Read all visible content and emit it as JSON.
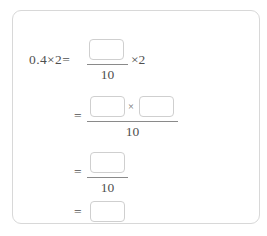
{
  "card": {
    "border_color": "#d8d8d8",
    "background": "#ffffff"
  },
  "problem": {
    "expression": "0.4×2=",
    "lines": [
      {
        "id": "line-1",
        "equals": "",
        "lead": "0.4×2=",
        "numerator_boxes": 1,
        "denominator": "10",
        "trailing": "×2"
      },
      {
        "id": "line-2",
        "equals": "=",
        "lead": "",
        "numerator_boxes": 2,
        "numerator_operator": "×",
        "denominator": "10",
        "trailing": ""
      },
      {
        "id": "line-3",
        "equals": "=",
        "lead": "",
        "numerator_boxes": 1,
        "denominator": "10",
        "trailing": ""
      },
      {
        "id": "line-4",
        "equals": "=",
        "lead": "",
        "numerator_boxes": 1,
        "denominator": "",
        "trailing": ""
      }
    ],
    "line1_lead": "0.4×2=",
    "line1_denominator": "10",
    "line1_trailing": "×2",
    "line2_equals": "=",
    "line2_operator": "×",
    "line2_denominator": "10",
    "line3_equals": "=",
    "line3_denominator": "10",
    "line4_equals": "="
  },
  "inputs": {
    "box1_value": "",
    "box1_placeholder": "",
    "box2a_value": "",
    "box2a_placeholder": "",
    "box2b_value": "",
    "box2b_placeholder": "",
    "box3_value": "",
    "box3_placeholder": "",
    "box4_value": "",
    "box4_placeholder": ""
  },
  "colors": {
    "text": "#4f4f4f",
    "box_border": "#cfcfcf",
    "card_border": "#d8d8d8",
    "rule": "#8a8a8a"
  }
}
